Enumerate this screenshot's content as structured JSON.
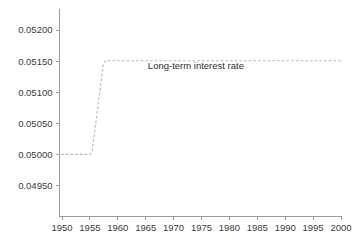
{
  "chart_data": {
    "type": "line",
    "title": "",
    "subtitle": "",
    "xlabel": "",
    "ylabel": "",
    "grid": false,
    "legend_position": "none",
    "xlim": [
      1948.5,
      2000.5
    ],
    "ylim": [
      0.0495,
      0.052154
    ],
    "xticks": [
      1950,
      1955,
      1960,
      1965,
      1970,
      1975,
      1980,
      1985,
      1990,
      1995,
      2000
    ],
    "xtick_labels": [
      "1950",
      "1955",
      "1960",
      "1965",
      "1970",
      "1975",
      "1980",
      "1985",
      "1990",
      "1995",
      "2000"
    ],
    "yticks": [
      0.0495,
      0.05,
      0.0505,
      0.051,
      0.0515,
      0.052
    ],
    "ytick_labels": [
      "0.04950",
      "0.05000",
      "0.05050",
      "0.05100",
      "0.05150",
      "0.05200"
    ],
    "series": [
      {
        "name": "Long-term interest rate",
        "style": "dashed",
        "color": "#b6b6b6",
        "x": [
          1949.0,
          1955.0,
          1955.4,
          1957.4,
          1957.8,
          2000.0
        ],
        "values": [
          0.05,
          0.05,
          0.050045,
          0.051455,
          0.051505,
          0.051505
        ]
      }
    ],
    "annotations": [
      {
        "text": "Long-term interest rate",
        "x": 1974.0,
        "y": 0.051365
      }
    ]
  },
  "axes": {
    "axis_color": "#9a9a9a",
    "text_color": "#3a3a3a"
  }
}
